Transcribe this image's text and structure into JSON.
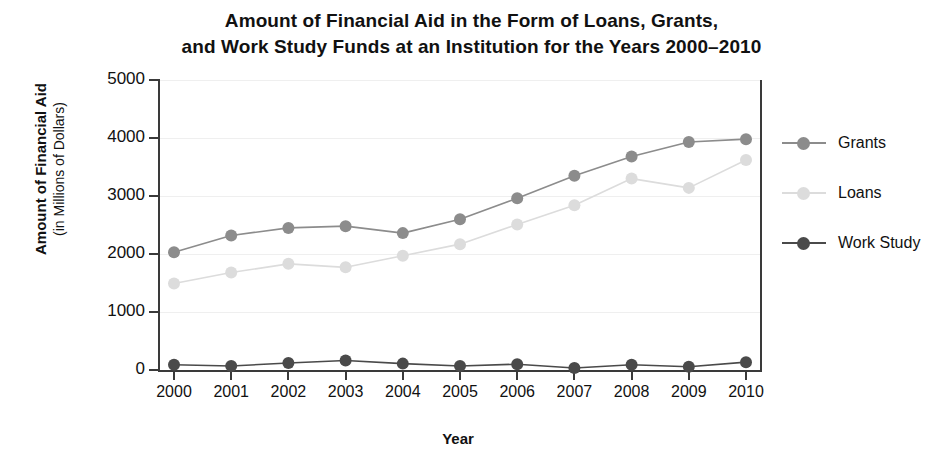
{
  "title": {
    "line1": "Amount of Financial Aid in the Form of Loans, Grants,",
    "line2": "and Work Study Funds at an Institution for the Years 2000–2010"
  },
  "y_axis": {
    "title_main": "Amount of Financial Aid",
    "title_sub": "(in Millions of Dollars)",
    "ticks": [
      "0",
      "1000",
      "2000",
      "3000",
      "4000",
      "5000"
    ]
  },
  "x_axis": {
    "title": "Year",
    "ticks": [
      "2000",
      "2001",
      "2002",
      "2003",
      "2004",
      "2005",
      "2006",
      "2007",
      "2008",
      "2009",
      "2010"
    ]
  },
  "legend": {
    "position": "right",
    "items": [
      {
        "label": "Grants",
        "color": "#8c8c8c"
      },
      {
        "label": "Loans",
        "color": "#dcdcdc"
      },
      {
        "label": "Work Study",
        "color": "#4a4a4a"
      }
    ]
  },
  "chart_data": {
    "type": "line",
    "title": "Amount of Financial Aid in the Form of Loans, Grants, and Work Study Funds at an Institution for the Years 2000–2010",
    "xlabel": "Year",
    "ylabel": "Amount of Financial Aid (in Millions of Dollars)",
    "categories": [
      2000,
      2001,
      2002,
      2003,
      2004,
      2005,
      2006,
      2007,
      2008,
      2009,
      2010
    ],
    "x": [
      2000,
      2001,
      2002,
      2003,
      2004,
      2005,
      2006,
      2007,
      2008,
      2009,
      2010
    ],
    "ylim": [
      0,
      5000
    ],
    "yticks": [
      0,
      1000,
      2000,
      3000,
      4000,
      5000
    ],
    "grid": true,
    "legend_position": "right",
    "series": [
      {
        "name": "Grants",
        "color": "#8c8c8c",
        "values": [
          2030,
          2320,
          2450,
          2480,
          2360,
          2600,
          2960,
          3350,
          3680,
          3930,
          3980
        ]
      },
      {
        "name": "Loans",
        "color": "#dcdcdc",
        "values": [
          1490,
          1680,
          1830,
          1770,
          1970,
          2170,
          2510,
          2840,
          3300,
          3140,
          3620
        ]
      },
      {
        "name": "Work Study",
        "color": "#4a4a4a",
        "values": [
          90,
          70,
          120,
          165,
          110,
          70,
          100,
          35,
          90,
          55,
          135
        ]
      }
    ]
  }
}
